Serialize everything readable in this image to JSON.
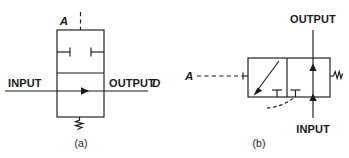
{
  "figure": {
    "caption_a": "(a)",
    "caption_b": "(b)"
  },
  "diagram_a": {
    "name": "spring-return-valve-symbol-a",
    "pilot_label": "A",
    "input_label": "INPUT",
    "output_label": "OUTPUT",
    "output_port_id": "D",
    "spring_icon": "spring-zigzag-icon",
    "pilot_icon": "dashed-pilot-line-icon",
    "flow_arrow_icon": "flow-arrow-right-icon",
    "blocked_port_icon": "blocked-port-icon",
    "box": {
      "x": 57,
      "y": 30,
      "width": 47,
      "height": 87,
      "divider_y": 73
    }
  },
  "diagram_b": {
    "name": "spring-return-valve-symbol-b",
    "pilot_label": "A",
    "input_label": "INPUT",
    "output_label": "OUTPUT",
    "spring_icon": "spring-zigzag-icon",
    "pilot_icon": "dashed-pilot-line-icon",
    "diagonal_arrow_icon": "diagonal-flow-arrow-icon",
    "flow_arrow_up_icon": "flow-arrow-up-icon",
    "blocked_port_icon": "blocked-port-tee-icon",
    "drain_icon": "curved-dashed-drain-icon",
    "box": {
      "x": 248,
      "y": 58,
      "width": 82,
      "height": 39,
      "divider_x": 287
    }
  },
  "colors": {
    "line": "#1a1a1a",
    "background": "#ffffff"
  }
}
